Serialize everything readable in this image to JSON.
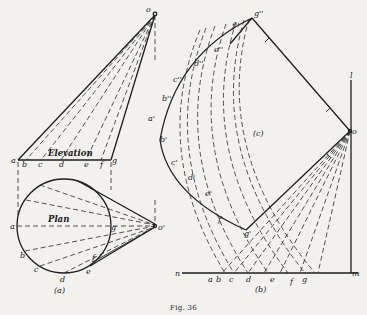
{
  "figure": {
    "caption": "Fig. 36",
    "panel_a_label": "(a)",
    "panel_b_label": "(b)",
    "panel_c_label": "(c)",
    "elevation_title": "Elevation",
    "plan_title": "Plan"
  },
  "elevation": {
    "apex_label": "o",
    "base_labels": [
      "a",
      "b",
      "c",
      "d",
      "e",
      "f",
      "g"
    ]
  },
  "plan": {
    "apex_label": "o'",
    "circle_labels": [
      "a",
      "b",
      "c",
      "d",
      "e",
      "f",
      "g"
    ]
  },
  "panel_b": {
    "line_left_label": "n",
    "line_right_label": "m",
    "top_label": "l",
    "base_labels": [
      "a",
      "b",
      "c",
      "d",
      "e",
      "f",
      "g"
    ],
    "vertex_label": "o",
    "g_prime_label": "g'"
  },
  "panel_c": {
    "top_label": "g''",
    "curve_labels_double": [
      "f''",
      "e''",
      "d''",
      "c''",
      "b''"
    ],
    "curve_labels_single": [
      "a'",
      "b'",
      "c'",
      "d'",
      "e'",
      "f'"
    ]
  }
}
